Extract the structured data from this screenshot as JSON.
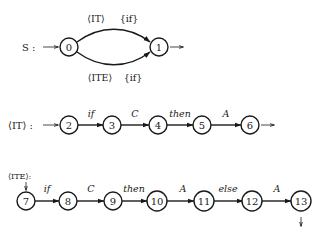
{
  "diagram": {
    "type": "finite-state automata",
    "automata": [
      {
        "name": "S",
        "label": "S :",
        "states": [
          "0",
          "1"
        ],
        "start": "0",
        "final": "1",
        "edges": [
          {
            "from": "0",
            "to": "1",
            "labels": [
              "⟨IT⟩",
              "{if}"
            ],
            "position": "upper"
          },
          {
            "from": "0",
            "to": "1",
            "labels": [
              "⟨ITE⟩",
              "{if}"
            ],
            "position": "lower"
          }
        ]
      },
      {
        "name": "IT",
        "label": "⟨IT⟩ :",
        "states": [
          "2",
          "3",
          "4",
          "5",
          "6"
        ],
        "start": "2",
        "final": "6",
        "edges": [
          {
            "from": "2",
            "to": "3",
            "label": "if"
          },
          {
            "from": "3",
            "to": "4",
            "label": "C"
          },
          {
            "from": "4",
            "to": "5",
            "label": "then"
          },
          {
            "from": "5",
            "to": "6",
            "label": "A"
          }
        ]
      },
      {
        "name": "ITE",
        "label": "⟨ITE⟩:",
        "states": [
          "7",
          "8",
          "9",
          "10",
          "11",
          "12",
          "13"
        ],
        "start": "7",
        "final": "13",
        "edges": [
          {
            "from": "7",
            "to": "8",
            "label": "if"
          },
          {
            "from": "8",
            "to": "9",
            "label": "C"
          },
          {
            "from": "9",
            "to": "10",
            "label": "then"
          },
          {
            "from": "10",
            "to": "11",
            "label": "A"
          },
          {
            "from": "11",
            "to": "12",
            "label": "else"
          },
          {
            "from": "12",
            "to": "13",
            "label": "A"
          }
        ]
      }
    ],
    "text": {
      "s_label": "S :",
      "it_label": "⟨IT⟩ :",
      "ite_label": "⟨ITE⟩:",
      "s_upper_nt": "⟨IT⟩",
      "s_upper_t": "{if}",
      "s_lower_nt": "⟨ITE⟩",
      "s_lower_t": "{if}",
      "n0": "0",
      "n1": "1",
      "n2": "2",
      "n3": "3",
      "n4": "4",
      "n5": "5",
      "n6": "6",
      "n7": "7",
      "n8": "8",
      "n9": "9",
      "n10": "10",
      "n11": "11",
      "n12": "12",
      "n13": "13",
      "e23": "if",
      "e34": "C",
      "e45": "then",
      "e56": "A",
      "e78": "if",
      "e89": "C",
      "e910": "then",
      "e1011": "A",
      "e1112": "else",
      "e1213": "A"
    }
  }
}
